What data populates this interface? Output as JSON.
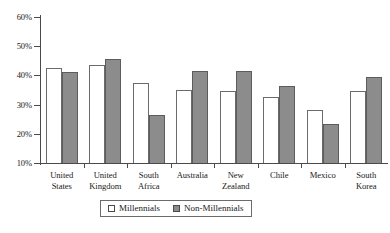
{
  "chart_data": {
    "type": "bar",
    "title": "",
    "subtitle": "",
    "xlabel": "",
    "ylabel": "",
    "ylim": [
      10,
      60
    ],
    "ytick_labels": [
      "60%",
      "50%",
      "40%",
      "30%",
      "20%",
      "10%"
    ],
    "ytick_values": [
      60,
      50,
      40,
      30,
      20,
      10
    ],
    "grid": false,
    "legend_position": "bottom",
    "categories": [
      "United States",
      "United Kingdom",
      "South Africa",
      "Australia",
      "New Zealand",
      "Chile",
      "Mexico",
      "South Korea"
    ],
    "category_lines": [
      [
        "United",
        "States"
      ],
      [
        "United",
        "Kingdom"
      ],
      [
        "South",
        "Africa"
      ],
      [
        "Australia",
        ""
      ],
      [
        "New",
        "Zealand"
      ],
      [
        "Chile",
        ""
      ],
      [
        "Mexico",
        ""
      ],
      [
        "South",
        "Korea"
      ]
    ],
    "series": [
      {
        "name": "Millennials",
        "color": "#ffffff",
        "values": [
          42.5,
          43.5,
          37.5,
          35.0,
          34.5,
          32.5,
          28.0,
          34.5
        ]
      },
      {
        "name": "Non-Millennials",
        "color": "#8c8c8c",
        "values": [
          41.0,
          45.5,
          26.5,
          41.5,
          41.5,
          36.5,
          23.5,
          39.5
        ]
      }
    ]
  },
  "legend": {
    "items": [
      {
        "label": "Millennials",
        "swatch": "white-square-icon"
      },
      {
        "label": "Non-Millennials",
        "swatch": "gray-square-icon"
      }
    ]
  },
  "colors": {
    "millennials": "#ffffff",
    "non_millennials": "#8c8c8c",
    "axis": "#4a4a4a",
    "text": "#1a1a1a",
    "background": "#ffffff"
  }
}
